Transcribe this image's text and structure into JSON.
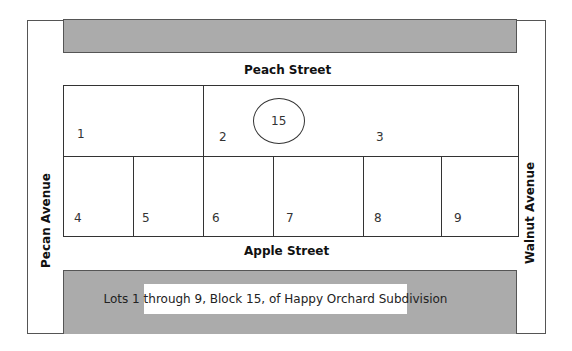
{
  "title": "Lots 1 through 9, Block 15, of Happy Orchard Subdivision",
  "streets": {
    "north": "Peach Street",
    "south": "Apple Street",
    "west": "Pecan Avenue",
    "east": "Walnut Avenue"
  },
  "block": {
    "number": "15"
  },
  "lots": [
    {
      "id": "1"
    },
    {
      "id": "2"
    },
    {
      "id": "3"
    },
    {
      "id": "4"
    },
    {
      "id": "5"
    },
    {
      "id": "6"
    },
    {
      "id": "7"
    },
    {
      "id": "8"
    },
    {
      "id": "9"
    }
  ],
  "colors": {
    "block_fill": "#ababab",
    "lines": "#333333",
    "background": "#ffffff"
  }
}
